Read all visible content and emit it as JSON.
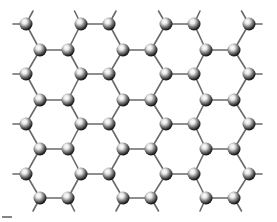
{
  "figure": {
    "bond_color": "#6a6a6a",
    "atom_highlight": "#ffffff",
    "atom_shadow": "#000000",
    "atom_radius": 6.5,
    "rows_a_y": [
      24,
      74,
      124,
      174
    ],
    "rows_b_y": [
      50,
      100,
      149,
      198
    ],
    "row_a_x": [
      26,
      81,
      109,
      166,
      194,
      249
    ],
    "row_b_x": [
      40,
      68,
      123,
      151,
      206,
      234
    ],
    "scale_bar": {
      "x1": 2,
      "x2": 12,
      "y": 217
    }
  }
}
